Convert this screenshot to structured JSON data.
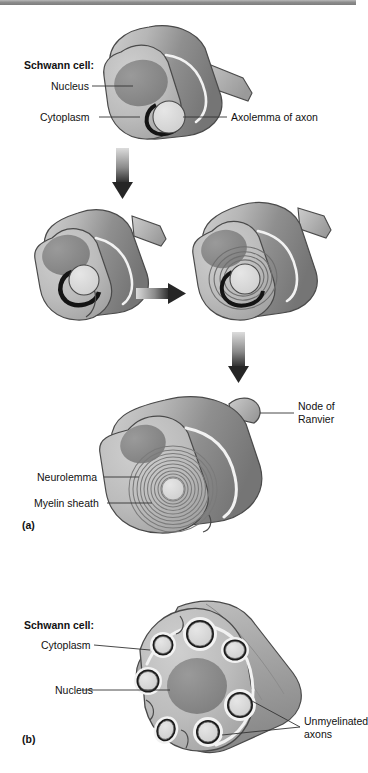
{
  "figure": {
    "panels": [
      {
        "id": "a",
        "label": "(a)",
        "caption": "Myelinated axon formation"
      },
      {
        "id": "b",
        "label": "(b)",
        "caption": "Unmyelinated axons"
      }
    ]
  },
  "panel_a": {
    "label": "(a)",
    "group_heading": "Schwann cell:",
    "labels": {
      "nucleus": "Nucleus",
      "cytoplasm": "Cytoplasm",
      "axolemma": "Axolemma of axon",
      "node_of_ranvier_line1": "Node of",
      "node_of_ranvier_line2": "Ranvier",
      "neurolemma": "Neurolemma",
      "myelin_sheath": "Myelin sheath"
    },
    "stages": [
      {
        "name": "stage-1-engulfing",
        "order": 1
      },
      {
        "name": "stage-2-wrapping-begin",
        "order": 2
      },
      {
        "name": "stage-3-wrapping-spiral",
        "order": 3
      },
      {
        "name": "stage-4-myelinated",
        "order": 4
      }
    ],
    "arrows": [
      {
        "name": "arrow-down-1",
        "direction": "down"
      },
      {
        "name": "arrow-right-1",
        "direction": "right"
      },
      {
        "name": "arrow-down-2",
        "direction": "down"
      }
    ],
    "myelin_wrap_count": 11
  },
  "panel_b": {
    "label": "(b)",
    "group_heading": "Schwann cell:",
    "labels": {
      "cytoplasm": "Cytoplasm",
      "nucleus": "Nucleus",
      "unmyelinated_line1": "Unmyelinated",
      "unmyelinated_line2": "axons"
    },
    "axon_count": 7
  },
  "colors": {
    "topbar": "#8d8d8d",
    "cell_body_light": "#c9c9c9",
    "cell_body_mid": "#a8a8a8",
    "cell_body_dark": "#7e7e7e",
    "nucleus": "#8a8a8a",
    "axon_fill": "#d8d8d8",
    "membrane_white": "#f2f2f2",
    "outline": "#4a4a4a",
    "axolemma_dark": "#111111",
    "arrow_light": "#d2d2d2",
    "arrow_dark": "#2b2b2b",
    "leader_line": "#333333",
    "text": "#111111"
  }
}
